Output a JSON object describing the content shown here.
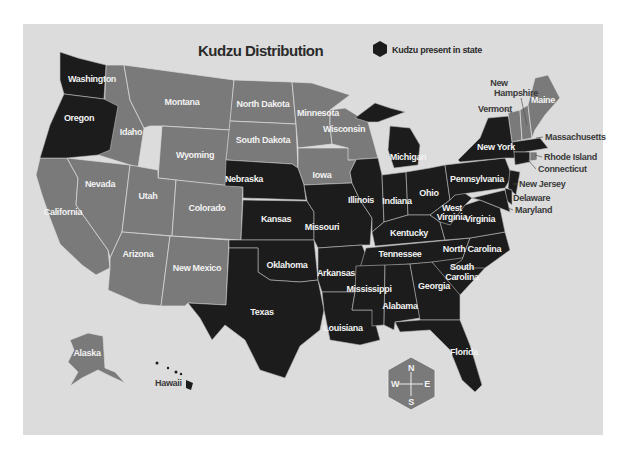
{
  "title": "Kudzu Distribution",
  "legend": {
    "label": "Kudzu present in state",
    "symbol": "hexagon",
    "color": "#1c1c1c"
  },
  "colors": {
    "kudzu_present": "#1c1c1c",
    "kudzu_absent": "#7a7a7a",
    "background": "#dcdcdc"
  },
  "compass": {
    "n": "N",
    "s": "S",
    "e": "E",
    "w": "W",
    "color": "#7a7a7a"
  },
  "states": {
    "washington": "Washington",
    "oregon": "Oregon",
    "california": "California",
    "nevada": "Nevada",
    "idaho": "Idaho",
    "montana": "Montana",
    "wyoming": "Wyoming",
    "utah": "Utah",
    "colorado": "Colorado",
    "arizona": "Arizona",
    "new_mexico": "New Mexico",
    "north_dakota": "North Dakota",
    "south_dakota": "South Dakota",
    "nebraska": "Nebraska",
    "kansas": "Kansas",
    "oklahoma": "Oklahoma",
    "texas": "Texas",
    "minnesota": "Minnesota",
    "iowa": "Iowa",
    "missouri": "Missouri",
    "arkansas": "Arkansas",
    "louisiana": "Louisiana",
    "wisconsin": "Wisconsin",
    "illinois": "Illinois",
    "michigan": "Michigan",
    "indiana": "Indiana",
    "ohio": "Ohio",
    "kentucky": "Kentucky",
    "tennessee": "Tennessee",
    "mississippi": "Mississippi",
    "alabama": "Alabama",
    "georgia": "Georgia",
    "florida": "Florida",
    "south_carolina_1": "South",
    "south_carolina_2": "Carolina",
    "north_carolina": "North Carolina",
    "virginia": "Virginia",
    "west_virginia_1": "West",
    "west_virginia_2": "Virginia",
    "pennsylvania": "Pennsylvania",
    "new_york": "New York",
    "vermont": "Vermont",
    "new_hampshire_1": "New",
    "new_hampshire_2": "Hampshire",
    "maine": "Maine",
    "massachusetts": "Massachusetts",
    "rhode_island": "Rhode Island",
    "connecticut": "Connecticut",
    "new_jersey": "New Jersey",
    "delaware": "Delaware",
    "maryland": "Maryland",
    "alaska": "Alaska",
    "hawaii": "Hawaii"
  },
  "kudzu_present": [
    "Washington",
    "Oregon",
    "Nebraska",
    "Kansas",
    "Oklahoma",
    "Texas",
    "Missouri",
    "Arkansas",
    "Louisiana",
    "Illinois",
    "Michigan",
    "Indiana",
    "Ohio",
    "Kentucky",
    "Tennessee",
    "Mississippi",
    "Alabama",
    "Georgia",
    "Florida",
    "South Carolina",
    "North Carolina",
    "Virginia",
    "West Virginia",
    "Pennsylvania",
    "New York",
    "Massachusetts",
    "Rhode Island",
    "Connecticut",
    "New Jersey",
    "Delaware",
    "Maryland",
    "Hawaii"
  ],
  "kudzu_absent": [
    "California",
    "Nevada",
    "Idaho",
    "Montana",
    "Wyoming",
    "Utah",
    "Colorado",
    "Arizona",
    "New Mexico",
    "North Dakota",
    "South Dakota",
    "Minnesota",
    "Iowa",
    "Wisconsin",
    "Vermont",
    "New Hampshire",
    "Maine",
    "Alaska"
  ]
}
